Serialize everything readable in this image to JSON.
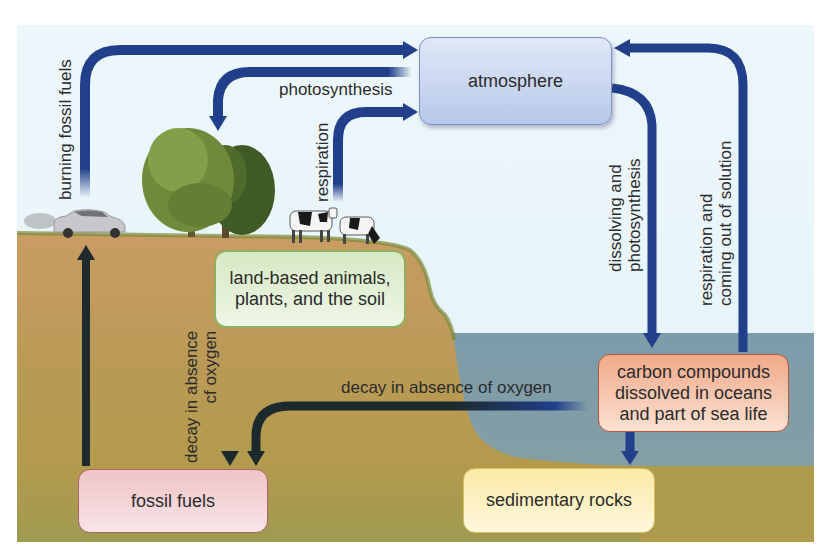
{
  "diagram": {
    "nodes": {
      "atmosphere": "atmosphere",
      "land": [
        "land-based animals,",
        "plants, and the soil"
      ],
      "fossil_fuels": "fossil fuels",
      "sedimentary_rocks": "sedimentary rocks",
      "ocean": [
        "carbon compounds",
        "dissolved in oceans",
        "and part of sea life"
      ]
    },
    "arrow_labels": {
      "burning": "burning fossil fuels",
      "photosynthesis": "photosynthesis",
      "respiration": "respiration",
      "dissolving": [
        "dissolving and",
        "photosynthesis"
      ],
      "ocean_release": [
        "respiration and",
        "coming out of solution"
      ],
      "land_decay": [
        "decay in absence",
        "cf oxygen"
      ],
      "ocean_decay": "decay in absence of oxygen"
    },
    "illustrations": {
      "car": "car-icon",
      "trees": "tree-icon",
      "cows": "cow-icon"
    },
    "colors": {
      "sky": "#eaf6fb",
      "ground": "#c9a566",
      "ground_deep": "#a79a4e",
      "water": "#7f9eab",
      "arrow_air": "#223f8c",
      "arrow_ground": "#1c2a2e"
    }
  }
}
